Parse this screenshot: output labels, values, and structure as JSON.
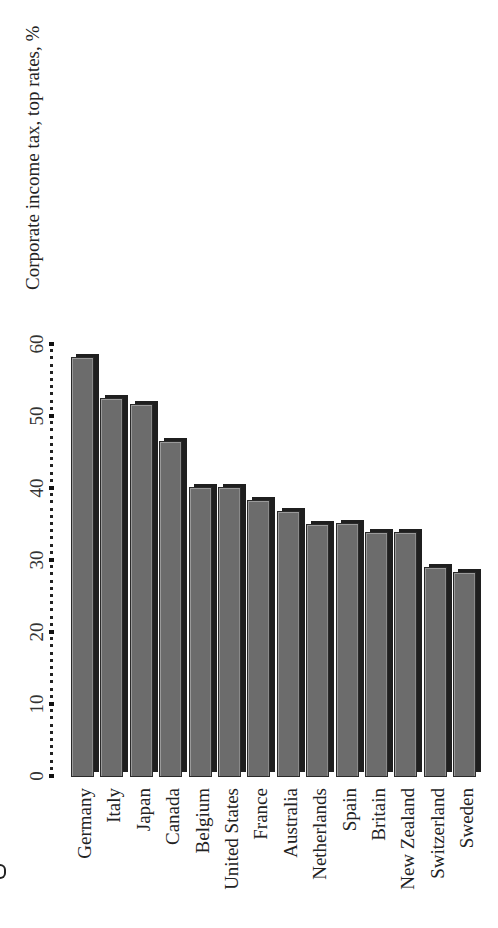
{
  "chart_data": {
    "type": "bar",
    "title": "Corporate income tax, top rates, %",
    "xlabel": "",
    "ylabel": "",
    "ylim": [
      0,
      60
    ],
    "yticks": [
      "0",
      "10",
      "20",
      "30",
      "40",
      "50",
      "60"
    ],
    "grid": false,
    "legend": null,
    "orientation": "rotated-90-ccw",
    "categories": [
      "Germany",
      "Italy",
      "Japan",
      "Canada",
      "Belgium",
      "United States",
      "France",
      "Australia",
      "Netherlands",
      "Spain",
      "Britain",
      "New Zealand",
      "Switzerland",
      "Sweden"
    ],
    "values": [
      58.2,
      52.5,
      51.6,
      46.5,
      40.2,
      40.1,
      38.3,
      36.8,
      35.0,
      35.1,
      33.9,
      33.9,
      29.0,
      28.4
    ]
  },
  "colors": {
    "bar_face": "#6c6c6c",
    "bar_shadow": "#1f1f1f",
    "background": "#ffffff"
  }
}
